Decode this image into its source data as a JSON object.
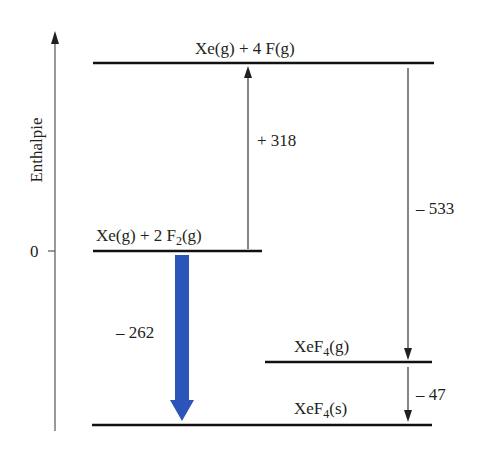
{
  "diagram": {
    "type": "enthalpy-level-diagram",
    "axis": {
      "label": "Enthalpie",
      "zero_tick": "0"
    },
    "levels": [
      {
        "id": "xe-4f",
        "main": "Xe(g) + 4 F(g)",
        "sub": "",
        "tail": ""
      },
      {
        "id": "xe-2f2",
        "main": "Xe(g) + 2 F",
        "sub": "2",
        "tail": "(g)"
      },
      {
        "id": "xef4-g",
        "main": "XeF",
        "sub": "4",
        "tail": "(g)"
      },
      {
        "id": "xef4-s",
        "main": "XeF",
        "sub": "4",
        "tail": "(s)"
      }
    ],
    "arrows": [
      {
        "id": "atomization",
        "from": "xe-2f2",
        "to": "xe-4f",
        "value": "+ 318"
      },
      {
        "id": "bond-formation",
        "from": "xe-4f",
        "to": "xef4-g",
        "value": "– 533"
      },
      {
        "id": "sublimation",
        "from": "xef4-g",
        "to": "xef4-s",
        "value": "– 47"
      },
      {
        "id": "formation",
        "from": "xe-2f2",
        "to": "xef4-s",
        "value": "– 262",
        "color": "#2b55b8"
      }
    ]
  }
}
